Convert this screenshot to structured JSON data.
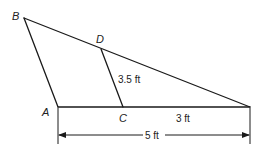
{
  "diagram": {
    "points": {
      "A": {
        "label": "A"
      },
      "B": {
        "label": "B"
      },
      "C": {
        "label": "C"
      },
      "D": {
        "label": "D"
      }
    },
    "measurements": {
      "DC": "3.5 ft",
      "C_to_right_vertex": "3 ft",
      "A_to_right_vertex": "5 ft"
    },
    "colors": {
      "stroke": "#1a1a1a",
      "text": "#222222",
      "background": "#ffffff"
    }
  }
}
